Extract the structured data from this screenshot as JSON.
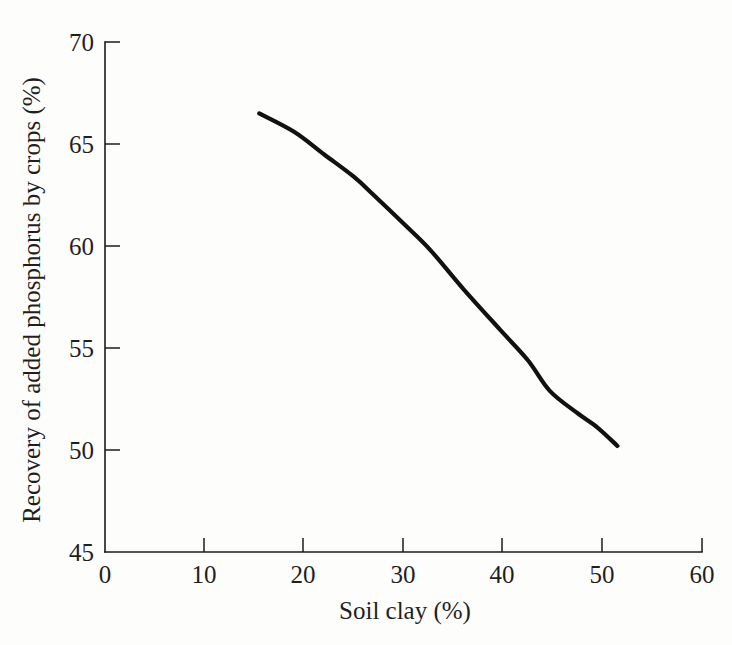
{
  "chart_data": {
    "type": "line",
    "title": "",
    "xlabel": "Soil clay (%)",
    "ylabel": "Recovery of added phosphorus by crops (%)",
    "xlim": [
      0,
      60
    ],
    "ylim": [
      45,
      70
    ],
    "xticks": [
      0,
      10,
      20,
      30,
      40,
      50,
      60
    ],
    "xtick_labels": [
      "0",
      "10",
      "20",
      "30",
      "40",
      "50",
      "60"
    ],
    "yticks": [
      45,
      50,
      55,
      60,
      65,
      70
    ],
    "ytick_labels": [
      "45",
      "50",
      "55",
      "60",
      "65",
      "70"
    ],
    "grid": false,
    "legend": null,
    "series": [
      {
        "name": "Recovery of added phosphorus by crops",
        "color": "#111111",
        "x": [
          15.5,
          19.0,
          22.0,
          25.0,
          27.0,
          30.0,
          32.7,
          36.0,
          39.7,
          42.5,
          44.7,
          47.5,
          49.5,
          51.5
        ],
        "y": [
          66.5,
          65.6,
          64.5,
          63.4,
          62.5,
          61.1,
          59.8,
          57.9,
          55.9,
          54.4,
          52.9,
          51.8,
          51.1,
          50.2
        ]
      }
    ]
  },
  "axes": {
    "x_axis_label": "Soil clay (%)",
    "y_axis_label": "Recovery of added phosphorus by crops (%)",
    "x_tick_labels": [
      "0",
      "10",
      "20",
      "30",
      "40",
      "50",
      "60"
    ],
    "y_tick_labels": [
      "45",
      "50",
      "55",
      "60",
      "65",
      "70"
    ]
  }
}
